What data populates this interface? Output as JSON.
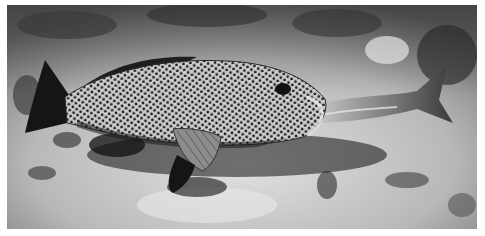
{
  "image": {
    "description": "Black-and-white underwater photograph of a spotted fish (grouper) on a sandy, rocky reef floor, swallowing another fish whose tail extends from its mouth",
    "subject": "spotted-grouper",
    "prey": "swallowed-fish",
    "background": "sandy-coral-seafloor",
    "tone": "grayscale",
    "colors": {
      "border": "#ffffff",
      "sand_light": "#d6d6d6",
      "sand_mid": "#a8a8a8",
      "rock_dark": "#2e2e2e",
      "fish_body": "#c8c8c8",
      "fish_spots": "#1e1e1e",
      "fins": "#1a1a1a"
    }
  }
}
